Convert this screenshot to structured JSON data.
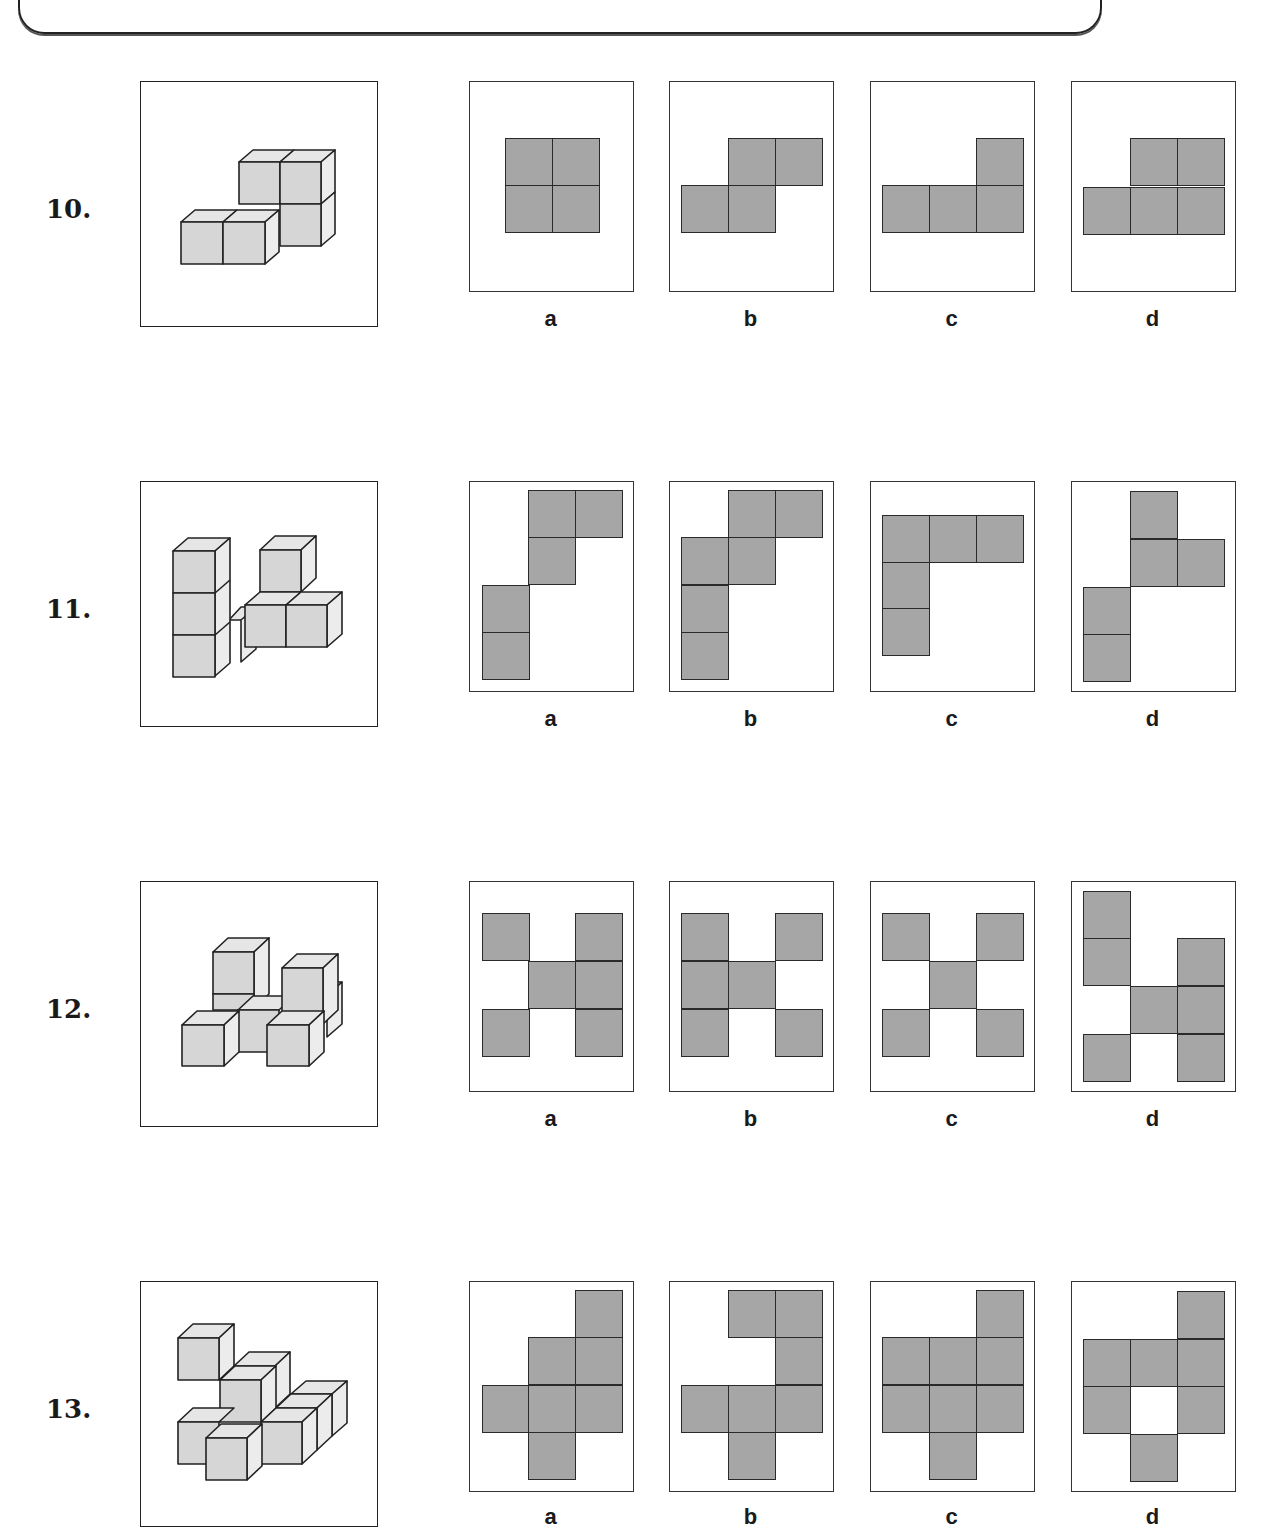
{
  "header": {
    "text": ""
  },
  "colors": {
    "cell_fill": "#a6a6a6",
    "cell_border": "#2a2a2a",
    "cube_front": "#d6d6d6",
    "cube_top": "#e6e6e6",
    "cube_side": "#ececec"
  },
  "questions": [
    {
      "number": "10.",
      "options": [
        {
          "label": "a",
          "cells": [
            [
              36,
              57
            ],
            [
              83,
              57
            ],
            [
              36,
              104
            ],
            [
              83,
              104
            ]
          ]
        },
        {
          "label": "b",
          "cells": [
            [
              59,
              57
            ],
            [
              106,
              57
            ],
            [
              12,
              104
            ],
            [
              59,
              104
            ]
          ]
        },
        {
          "label": "c",
          "cells": [
            [
              106,
              57
            ],
            [
              12,
              104
            ],
            [
              59,
              104
            ],
            [
              106,
              104
            ]
          ]
        },
        {
          "label": "d",
          "cells": [
            [
              59,
              57
            ],
            [
              106,
              57
            ],
            [
              12,
              106
            ],
            [
              59,
              106
            ],
            [
              106,
              106
            ]
          ]
        }
      ]
    },
    {
      "number": "11.",
      "options": [
        {
          "label": "a",
          "cells": [
            [
              59,
              9
            ],
            [
              106,
              9
            ],
            [
              59,
              56
            ],
            [
              13,
              104
            ],
            [
              13,
              151
            ]
          ]
        },
        {
          "label": "b",
          "cells": [
            [
              59,
              9
            ],
            [
              106,
              9
            ],
            [
              12,
              56
            ],
            [
              59,
              56
            ],
            [
              12,
              104
            ],
            [
              12,
              151
            ]
          ]
        },
        {
          "label": "c",
          "cells": [
            [
              12,
              34
            ],
            [
              59,
              34
            ],
            [
              106,
              34
            ],
            [
              12,
              81
            ],
            [
              12,
              127
            ]
          ]
        },
        {
          "label": "d",
          "cells": [
            [
              59,
              10
            ],
            [
              59,
              58
            ],
            [
              106,
              58
            ],
            [
              12,
              106
            ],
            [
              12,
              153
            ]
          ]
        }
      ]
    },
    {
      "number": "12.",
      "options": [
        {
          "label": "a",
          "cells": [
            [
              13,
              32
            ],
            [
              106,
              32
            ],
            [
              59,
              80
            ],
            [
              106,
              80
            ],
            [
              13,
              128
            ],
            [
              106,
              128
            ]
          ]
        },
        {
          "label": "b",
          "cells": [
            [
              12,
              32
            ],
            [
              106,
              32
            ],
            [
              12,
              80
            ],
            [
              59,
              80
            ],
            [
              12,
              128
            ],
            [
              106,
              128
            ]
          ]
        },
        {
          "label": "c",
          "cells": [
            [
              12,
              32
            ],
            [
              106,
              32
            ],
            [
              59,
              80
            ],
            [
              12,
              128
            ],
            [
              106,
              128
            ]
          ]
        },
        {
          "label": "d",
          "cells": [
            [
              12,
              10
            ],
            [
              12,
              57
            ],
            [
              106,
              57
            ],
            [
              59,
              105
            ],
            [
              106,
              105
            ],
            [
              12,
              153
            ],
            [
              106,
              153
            ]
          ]
        }
      ]
    },
    {
      "number": "13.",
      "options": [
        {
          "label": "a",
          "cells": [
            [
              106,
              9
            ],
            [
              59,
              56
            ],
            [
              106,
              56
            ],
            [
              13,
              104
            ],
            [
              59,
              104
            ],
            [
              106,
              104
            ],
            [
              59,
              151
            ]
          ]
        },
        {
          "label": "b",
          "cells": [
            [
              59,
              9
            ],
            [
              106,
              9
            ],
            [
              106,
              56
            ],
            [
              12,
              104
            ],
            [
              59,
              104
            ],
            [
              106,
              104
            ],
            [
              59,
              151
            ]
          ]
        },
        {
          "label": "c",
          "cells": [
            [
              106,
              9
            ],
            [
              12,
              56
            ],
            [
              59,
              56
            ],
            [
              106,
              56
            ],
            [
              12,
              104
            ],
            [
              59,
              104
            ],
            [
              106,
              104
            ],
            [
              59,
              151
            ]
          ]
        },
        {
          "label": "d",
          "cells": [
            [
              106,
              10
            ],
            [
              12,
              58
            ],
            [
              59,
              58
            ],
            [
              106,
              58
            ],
            [
              12,
              105
            ],
            [
              106,
              105
            ],
            [
              59,
              153
            ]
          ]
        }
      ]
    }
  ]
}
